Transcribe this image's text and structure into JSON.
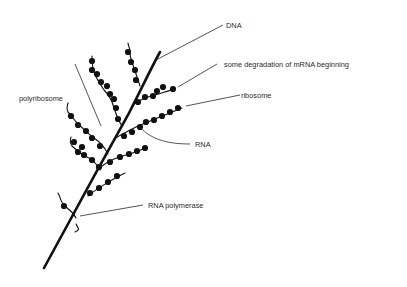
{
  "diagram": {
    "labels": {
      "dna": "DNA",
      "degradation": "some degradation of mRNA beginning",
      "ribosome": "ribosome",
      "polyribosome": "polyribosome",
      "rna": "RNA",
      "rna_polymerase": "RNA polymerase"
    },
    "colors": {
      "ink": "#111111",
      "label_text": "#2a2a2a",
      "background": "#ffffff"
    }
  }
}
